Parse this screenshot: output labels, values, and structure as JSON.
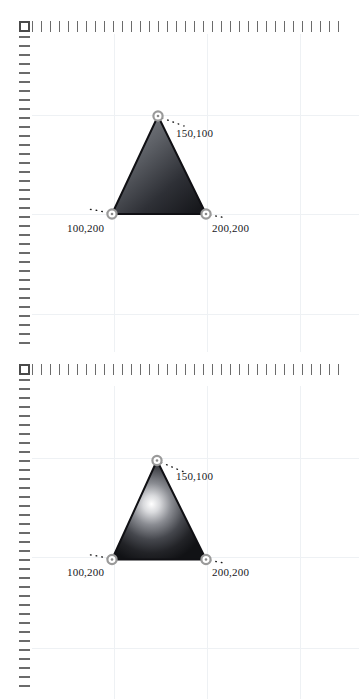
{
  "app": {
    "canvas_background": "#ffffff",
    "ruler_tick_color": "#6b6b6b",
    "grid_line_color": "#eef1f4",
    "shape_outline_color": "#111111",
    "handle_ring_color": "#9a9a9a",
    "handle_fill_color": "#ffffff",
    "leader_dot_color": "#1a1a1a"
  },
  "panels": [
    {
      "id": "panel-top",
      "name": "linear-gradient-triangle-canvas",
      "corner_box": "ruler-origin-box",
      "fill_type": "linear-gradient",
      "gradient": {
        "type": "linear",
        "angle_deg": 145,
        "stops": [
          {
            "offset": "0%",
            "color": "#8d8f95"
          },
          {
            "offset": "38%",
            "color": "#5d6066"
          },
          {
            "offset": "72%",
            "color": "#2e3036"
          },
          {
            "offset": "100%",
            "color": "#17181c"
          }
        ]
      },
      "shape": {
        "name": "triangle",
        "vertices": [
          {
            "name": "apex",
            "x": 158,
            "y": 116,
            "label": "150,100",
            "label_x": 176,
            "label_y": 127
          },
          {
            "name": "bottom-left",
            "x": 112,
            "y": 214,
            "label": "100,200",
            "label_x": 67,
            "label_y": 222
          },
          {
            "name": "bottom-right",
            "x": 206,
            "y": 214,
            "label": "200,200",
            "label_x": 212,
            "label_y": 222
          }
        ]
      }
    },
    {
      "id": "panel-bottom",
      "name": "radial-gradient-triangle-canvas",
      "corner_box": "ruler-origin-box",
      "fill_type": "radial-gradient",
      "gradient": {
        "type": "radial",
        "center_x_pct": 42,
        "center_y_pct": 44,
        "stops": [
          {
            "offset": "0%",
            "color": "#ffffff"
          },
          {
            "offset": "14%",
            "color": "#d9dadd"
          },
          {
            "offset": "34%",
            "color": "#8a8c92"
          },
          {
            "offset": "58%",
            "color": "#45474d"
          },
          {
            "offset": "80%",
            "color": "#222327"
          },
          {
            "offset": "100%",
            "color": "#111215"
          }
        ]
      },
      "shape": {
        "name": "triangle",
        "vertices": [
          {
            "name": "apex",
            "x": 157,
            "y": 106,
            "label": "150,100",
            "label_x": 176,
            "label_y": 118
          },
          {
            "name": "bottom-left",
            "x": 112,
            "y": 205,
            "label": "100,200",
            "label_x": 67,
            "label_y": 214
          },
          {
            "name": "bottom-right",
            "x": 206,
            "y": 205,
            "label": "200,200",
            "label_x": 212,
            "label_y": 214
          }
        ]
      }
    }
  ],
  "rulers": {
    "top": {
      "start_x": 32,
      "spacing": 9,
      "count": 35,
      "tick_length": 11
    },
    "left": {
      "start_y": 36,
      "spacing": 9,
      "tick_length": 11
    }
  },
  "grid": {
    "vertical_x": [
      82,
      175,
      268
    ],
    "horizontal_y_top": [
      81,
      180,
      280
    ],
    "horizontal_y_bottom": [
      72,
      171,
      262
    ]
  }
}
